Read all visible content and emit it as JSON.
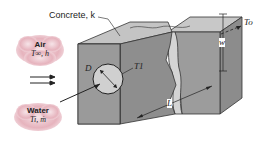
{
  "diagram": {
    "concrete_label": "Concrete, k",
    "air_cloud": {
      "title": "Air",
      "params": "T∞, h"
    },
    "water_cloud": {
      "title": "Water",
      "params": "Ti, ṁ"
    },
    "labels": {
      "D": "D",
      "T1": "T1",
      "To": "To",
      "w": "w",
      "L": "L"
    },
    "colors": {
      "cloud": "#e8b8c0",
      "front_face": "#9a9a9a",
      "top_face": "#c4c4c4",
      "side_face": "#8a8a8a",
      "pipe": "#cfcfcf",
      "line": "#222222"
    }
  }
}
